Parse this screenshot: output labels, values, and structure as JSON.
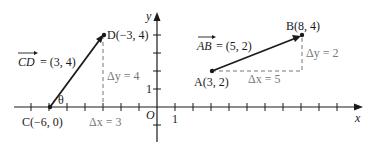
{
  "figure": {
    "axes": {
      "x_label": "x",
      "y_label": "y",
      "origin_label": "O",
      "x_tick_label": "1",
      "y_tick_label": "1"
    },
    "vector_cd": {
      "label": "CD = (3, 4)",
      "vec_name": "CD",
      "components": "= (3, 4)",
      "start_label": "C(−6, 0)",
      "end_label": "D(−3, 4)",
      "angle_label": "θ",
      "dx_label": "Δx = 3",
      "dy_label": "Δy = 4"
    },
    "vector_ab": {
      "label": "AB = (5, 2)",
      "vec_name": "AB",
      "components": "= (5, 2)",
      "start_label": "A(3, 2)",
      "end_label": "B(8, 4)",
      "dx_label": "Δx = 5",
      "dy_label": "Δy = 2"
    },
    "colors": {
      "ink": "#1a1a1a",
      "dashed": "#777777"
    }
  }
}
